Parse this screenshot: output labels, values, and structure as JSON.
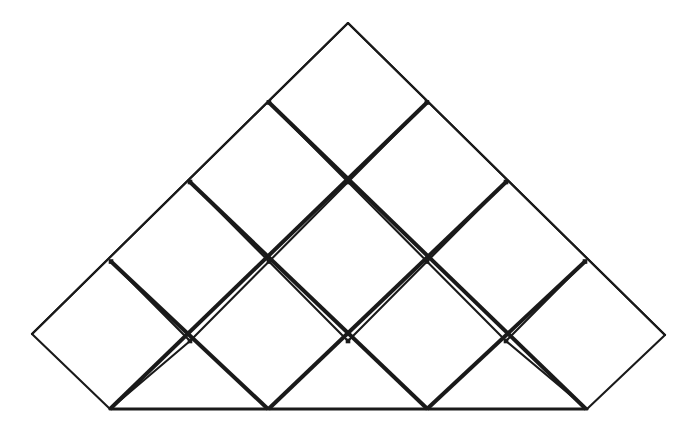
{
  "figure": {
    "background_color": "#ffffff",
    "line_color": "#1a1a1a",
    "fill_color": "#ffffff",
    "canvas": {
      "width": 700,
      "height": 429
    },
    "geometry": {
      "apex": {
        "x": 348,
        "y": 23
      },
      "left_vertex": {
        "x": 32,
        "y": 334
      },
      "right_vertex": {
        "x": 665,
        "y": 335
      },
      "baseline_y": 409,
      "baseline_x_start": 110,
      "baseline_x_end": 587,
      "half_width": 79,
      "half_height": 79.5,
      "rows": 4,
      "diamonds_per_row": [
        1,
        2,
        3,
        4
      ],
      "total_diamonds": 10
    },
    "stroke_widths": {
      "outer_boundary": 2.1,
      "inner_lattice": 4.0,
      "inner_gap": 1.1,
      "baseline": 3.2
    },
    "lattice_nodes": {
      "row_y": [
        23,
        102.5,
        182,
        261.5,
        341,
        409
      ],
      "row0_x": [
        348
      ],
      "row1_x": [
        269,
        427
      ],
      "row2_x": [
        190,
        348,
        506
      ],
      "row3_x": [
        111,
        269,
        427,
        585
      ],
      "row4_x": [
        32,
        190,
        348,
        506,
        665
      ],
      "baseline_x": [
        110,
        268,
        427,
        587
      ]
    },
    "outer_outline_points": "348,23 665,335 587,409 427,409 268,409 110,409 32,334",
    "counts": {
      "full_diamonds": 6,
      "clipped_triangles": 8,
      "half_diamonds_on_edges": 2
    }
  }
}
